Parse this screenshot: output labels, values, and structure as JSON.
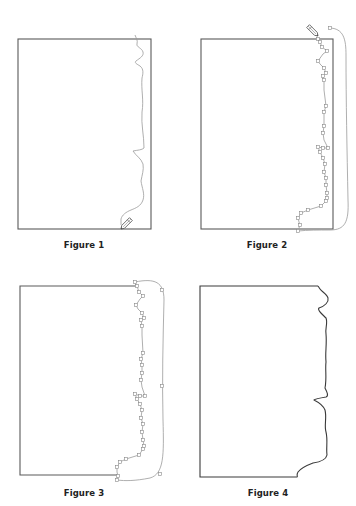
{
  "colors": {
    "frame": "#5a5a5a",
    "path": "#9a9a9a",
    "final_edge": "#3a3a3a",
    "anchor_fill": "#ffffff",
    "anchor_stroke": "#888888",
    "caption": "#222222"
  },
  "figures": [
    {
      "id": "figure-1",
      "caption": "Figure 1",
      "caption_pos": [
        84,
        240
      ],
      "frame": {
        "x": 18,
        "y": 39,
        "w": 133,
        "h": 190
      },
      "frame_path": null,
      "freehand_path": "M135,35 C136,38 138,40 137,44 C136,47 142,48 143,52 C144,56 140,58 136,61 C134,63 137,64 140,66 C144,69 143,74 142,78 C141,90 144,100 142,112 C141,125 144,135 144,148 C142,150 138,150 133,151 C136,156 141,158 143,164 C144,170 142,175 141,181 C142,188 145,194 143,200 C141,206 136,208 131,210 C126,212 122,215 121,219 C121,221 121,223 121,225",
      "anchors": [],
      "loop_path": null,
      "pencil": {
        "x": 121,
        "y": 229,
        "angle": -45,
        "icon": "pencil-icon"
      }
    },
    {
      "id": "figure-2",
      "caption": "Figure 2",
      "caption_pos": [
        267,
        240
      ],
      "frame": {
        "x": 201,
        "y": 39,
        "w": 132,
        "h": 190
      },
      "frame_path": null,
      "freehand_path": "M318,39 L320,42 L322,47 L327,51 L323,54 L318,61 L320,64 L324,68 L326,73 L323,76 L324,80 L324,90 L326,106 L324,112 L324,118 L324,126 L323,133 L324,140 L328,148 L323,148 L318,147 L320,152 L323,158 L325,164 L324,172 L326,178 L326,185 L327,193 L327,198 L326,201 L321,206 L308,210 L301,213 L298,218 L299,222 L300,225 L298,231",
      "anchors": [
        [
          318,
          39
        ],
        [
          320,
          42
        ],
        [
          322,
          47
        ],
        [
          327,
          51
        ],
        [
          318,
          61
        ],
        [
          324,
          68
        ],
        [
          326,
          73
        ],
        [
          323,
          76
        ],
        [
          324,
          80
        ],
        [
          326,
          106
        ],
        [
          324,
          112
        ],
        [
          324,
          126
        ],
        [
          323,
          133
        ],
        [
          328,
          148
        ],
        [
          323,
          148
        ],
        [
          318,
          147
        ],
        [
          320,
          152
        ],
        [
          323,
          158
        ],
        [
          325,
          164
        ],
        [
          324,
          172
        ],
        [
          326,
          178
        ],
        [
          326,
          185
        ],
        [
          327,
          193
        ],
        [
          327,
          198
        ],
        [
          326,
          201
        ],
        [
          321,
          206
        ],
        [
          308,
          210
        ],
        [
          301,
          213
        ],
        [
          298,
          218
        ],
        [
          300,
          225
        ],
        [
          298,
          231
        ]
      ],
      "loop_path": "M329,28 C344,28 346,40 346,55 C346,100 347,150 348,200 C349,222 345,230 330,230 C318,230 308,230 298,231",
      "loop_anchors": [
        [
          330,
          28
        ]
      ],
      "pencil": {
        "x": 318,
        "y": 36,
        "angle": -135,
        "icon": "pencil-icon"
      }
    },
    {
      "id": "figure-3",
      "caption": "Figure 3",
      "caption_pos": [
        84,
        488
      ],
      "frame": null,
      "frame_path": "M136,286 L20,286 L20,475 L117,475",
      "freehand_path": "M135,282 L137,286 L139,292 L143,296 L140,299 L136,305 L138,309 L142,313 L144,318 L141,320 L142,326 L142,335 L143,353 L141,359 L142,365 L142,373 L141,380 L142,387 L145,396 L140,396 L135,394 L137,399 L140,404 L142,410 L141,418 L143,424 L142,432 L143,440 L144,446 L143,449 L139,455 L126,459 L120,462 L117,467 L117,472 L118,476 L117,480",
      "anchors": [
        [
          135,
          282
        ],
        [
          137,
          286
        ],
        [
          139,
          292
        ],
        [
          143,
          296
        ],
        [
          136,
          305
        ],
        [
          142,
          313
        ],
        [
          144,
          318
        ],
        [
          141,
          320
        ],
        [
          142,
          326
        ],
        [
          143,
          353
        ],
        [
          141,
          359
        ],
        [
          142,
          365
        ],
        [
          142,
          373
        ],
        [
          141,
          380
        ],
        [
          145,
          396
        ],
        [
          140,
          396
        ],
        [
          135,
          394
        ],
        [
          137,
          399
        ],
        [
          140,
          404
        ],
        [
          142,
          410
        ],
        [
          141,
          418
        ],
        [
          143,
          424
        ],
        [
          142,
          432
        ],
        [
          143,
          440
        ],
        [
          144,
          446
        ],
        [
          143,
          449
        ],
        [
          139,
          455
        ],
        [
          126,
          459
        ],
        [
          120,
          462
        ],
        [
          117,
          467
        ],
        [
          118,
          476
        ],
        [
          117,
          480
        ]
      ],
      "loop_path": "M135,282 C155,278 164,282 164,300 C163,340 162,380 163,420 C164,455 164,474 150,478 C135,481 125,481 117,480",
      "loop_anchors": [
        [
          162,
          290
        ],
        [
          162,
          386
        ],
        [
          160,
          474
        ]
      ],
      "pencil": null
    },
    {
      "id": "figure-4",
      "caption": "Figure 4",
      "caption_pos": [
        268,
        488
      ],
      "frame": null,
      "frame_path": "M318,286 L200,286 L200,477 L297,477",
      "freehand_path": "M318,286 L320,289 C322,292 327,294 328,298 C329,302 325,306 319,308 C317,310 322,314 326,318 C328,323 325,328 326,334 C327,345 325,352 326,362 C325,370 327,378 325,388 C327,392 329,396 326,397 C320,398 315,399 314,400 C318,402 323,405 325,410 C327,418 324,425 326,432 C328,440 326,448 327,455 C326,460 320,462 313,463 C305,466 301,468 298,472 C296,475 298,477 297,477",
      "anchors": [],
      "loop_path": null,
      "pencil": null,
      "final": true
    }
  ]
}
